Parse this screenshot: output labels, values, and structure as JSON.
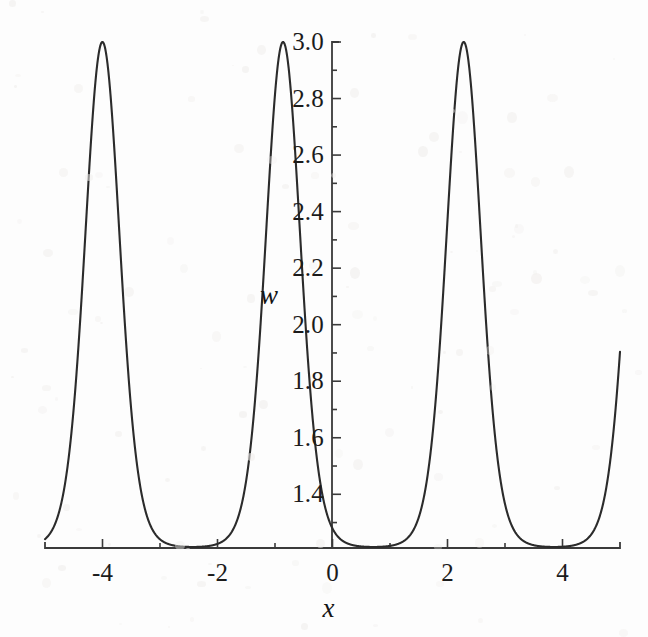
{
  "figure": {
    "background_color": "#fdfdfd",
    "curve_color": "#2b2b2b",
    "axis_color": "#3a3a3a",
    "text_color": "#1b1b1b"
  },
  "chart_data": {
    "type": "line",
    "title": "",
    "subtitle": "",
    "xlabel": "x",
    "ylabel": "w",
    "xlim": [
      -5,
      5
    ],
    "ylim": [
      1.21,
      3.05
    ],
    "grid": false,
    "legend": null,
    "x_ticks": [
      -4,
      -2,
      0,
      2,
      4
    ],
    "x_tick_labels": [
      "-4",
      "-2",
      "0",
      "2",
      "4"
    ],
    "x_minor_ticks": [
      -5,
      -3,
      -1,
      1,
      3,
      5
    ],
    "y_ticks": [
      1.4,
      1.6,
      1.8,
      2.0,
      2.2,
      2.4,
      2.6,
      2.8,
      3.0
    ],
    "y_tick_labels": [
      "1.4",
      "1.6",
      "1.8",
      "2.0",
      "2.2",
      "2.4",
      "2.6",
      "2.8",
      "3.0"
    ],
    "y_minor_ticks": [
      1.3,
      1.5,
      1.7,
      1.9,
      2.1,
      2.3,
      2.5,
      2.7,
      2.9
    ],
    "series": [
      {
        "name": "w(x)",
        "color": "#2b2b2b",
        "line_width": 2.1,
        "peak_value": 3.0,
        "min_value": 1.207,
        "period": 3.1416,
        "peak_positions": [
          -4.0,
          -0.86,
          2.3
        ],
        "min_positions": [
          -2.43,
          0.72,
          3.87
        ],
        "sharpness": 5.6,
        "value_at_x0": 1.5,
        "value_at_xmin_edge": 1.35,
        "value_at_xmax_edge": 1.93
      }
    ],
    "annotations": []
  }
}
